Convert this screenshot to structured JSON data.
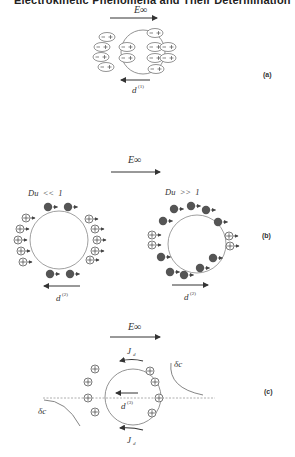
{
  "header": {
    "title": "Electrokinetic Phenomena and Their Determination"
  },
  "panels": {
    "a": {
      "label": "(a)",
      "field_label": "E∞",
      "dipole_label": "d",
      "dipole_superscript": "(1)",
      "dipole_text": "− +"
    },
    "b": {
      "label": "(b)",
      "field_label": "E∞",
      "left": {
        "condition": "Du  <<  1",
        "dipole_label": "d",
        "dipole_superscript": "(2)"
      },
      "right": {
        "condition": "Du  >>  1",
        "dipole_label": "d",
        "dipole_superscript": "(2)"
      }
    },
    "c": {
      "label": "(c)",
      "field_label": "E∞",
      "flux_label": "J",
      "flux_subscript": "d",
      "dipole_label": "d",
      "dipole_superscript": "(3)",
      "conc_label": "δc"
    }
  },
  "colors": {
    "ink": "#333333",
    "ion_fill": "#555555",
    "line": "#888888"
  }
}
